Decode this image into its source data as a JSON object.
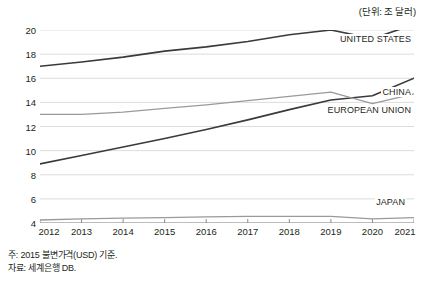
{
  "unit_note": "(단위: 조 달러)",
  "footnotes": [
    "주: 2015 불변가격(USD) 기준.",
    "자료: 세계은행 DB."
  ],
  "axes": {
    "y_ticks": [
      "4",
      "6",
      "8",
      "10",
      "12",
      "14",
      "16",
      "18",
      "20"
    ],
    "x_ticks": [
      "2012",
      "2013",
      "2014",
      "2015",
      "2016",
      "2017",
      "2018",
      "2019",
      "2020",
      "2021"
    ]
  },
  "series_labels": {
    "united_states": "UNITED STATES",
    "china": "CHINA",
    "european_union": "EUROPEAN UNION",
    "japan": "JAPAN"
  },
  "colors": {
    "dark_line": "#3a3a3a",
    "gray_line": "#9a9a9a",
    "grid": "#dcdcdc",
    "axis": "#8c8c8c",
    "text": "#231f20",
    "background": "#ffffff"
  },
  "chart_data": {
    "type": "line",
    "title": "",
    "subtitle": "",
    "xlabel": "",
    "ylabel": "",
    "unit": "조 달러",
    "note": "주: 2015 불변가격(USD) 기준.",
    "source": "자료: 세계은행 DB.",
    "grid": true,
    "legend_position": "inline-right",
    "x": [
      2012,
      2013,
      2014,
      2015,
      2016,
      2017,
      2018,
      2019,
      2020,
      2021
    ],
    "xlim": [
      2012,
      2021
    ],
    "ylim": [
      4,
      20
    ],
    "y_tick_values": [
      4,
      6,
      8,
      10,
      12,
      14,
      16,
      18,
      20
    ],
    "series": [
      {
        "name": "UNITED STATES",
        "color": "#3a3a3a",
        "width": 1.6,
        "values": [
          17.0,
          17.35,
          17.75,
          18.25,
          18.6,
          19.05,
          19.6,
          20.0,
          19.3,
          20.45
        ]
      },
      {
        "name": "CHINA",
        "color": "#3a3a3a",
        "width": 1.6,
        "values": [
          8.9,
          9.6,
          10.3,
          11.0,
          11.75,
          12.55,
          13.4,
          14.2,
          14.55,
          16.0
        ]
      },
      {
        "name": "EUROPEAN UNION",
        "color": "#9a9a9a",
        "width": 1.3,
        "values": [
          13.0,
          13.0,
          13.2,
          13.5,
          13.8,
          14.15,
          14.5,
          14.85,
          13.9,
          14.7
        ]
      },
      {
        "name": "JAPAN",
        "color": "#9a9a9a",
        "width": 1.3,
        "values": [
          4.25,
          4.35,
          4.4,
          4.45,
          4.5,
          4.55,
          4.55,
          4.55,
          4.35,
          4.45
        ]
      }
    ]
  }
}
